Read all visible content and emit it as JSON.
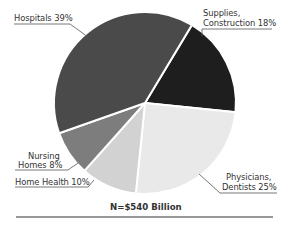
{
  "chart_data": {
    "type": "pie",
    "title": "",
    "total_label": "N=$540 Billion",
    "categories": [
      "Hospitals",
      "Supplies, Construction",
      "Physicians, Dentists",
      "Home Health",
      "Nursing Homes"
    ],
    "values": [
      39,
      18,
      25,
      10,
      8
    ],
    "units": "%",
    "start_angle_deg": 31,
    "order": "clockwise from Supplies, Construction",
    "slices": [
      {
        "name": "Supplies, Construction",
        "value": 18,
        "color": "#1e1e1e",
        "label_lines": [
          "Supplies,",
          "Construction 18%"
        ]
      },
      {
        "name": "Physicians, Dentists",
        "value": 25,
        "color": "#e9e9e9",
        "label_lines": [
          "Physicians,",
          "Dentists 25%"
        ]
      },
      {
        "name": "Home Health",
        "value": 10,
        "color": "#d2d2d2",
        "label_lines": [
          "Home Health 10%"
        ]
      },
      {
        "name": "Nursing Homes",
        "value": 8,
        "color": "#7d7d7d",
        "label_lines": [
          "Nursing",
          "Homes 8%"
        ]
      },
      {
        "name": "Hospitals",
        "value": 39,
        "color": "#4a4a4a",
        "label_lines": [
          "Hospitals 39%"
        ]
      }
    ],
    "legend": "none (callout labels)"
  },
  "labels": {
    "hospitals": "Hospitals 39%",
    "supplies_1": "Supplies,",
    "supplies_2": "Construction 18%",
    "physicians_1": "Physicians,",
    "physicians_2": "Dentists 25%",
    "home_health": "Home Health 10%",
    "nursing_1": "Nursing",
    "nursing_2": "Homes 8%",
    "total": "N=$540 Billion"
  }
}
